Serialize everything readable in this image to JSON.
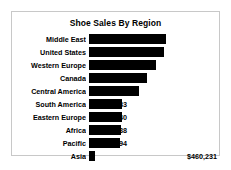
{
  "chart_data": {
    "type": "bar",
    "orientation": "horizontal",
    "title": "Shoe Sales By Region",
    "xlabel": "",
    "ylabel": "",
    "grid": false,
    "legend": false,
    "value_prefix": "$",
    "categories": [
      "Middle East",
      "United States",
      "Western Europe",
      "Canada",
      "Central America",
      "South America",
      "Eastern Europe",
      "Africa",
      "Pacific",
      "Asia"
    ],
    "values": [
      5631779,
      5503986,
      4873000,
      4255712,
      3657753,
      2434783,
      2394940,
      2342588,
      2296794,
      460231
    ],
    "value_labels": [
      "$5,631,779",
      "$5,503,986",
      "$4,873,000",
      "$4,255,712",
      "$3,657,753",
      "$2,434,783",
      "$2,394,940",
      "$2,342,588",
      "$2,296,794",
      "$460,231"
    ],
    "xlim": [
      0,
      5631779
    ],
    "bar_color": "#000000",
    "frame_color": "#c8c8c8",
    "background": "#ffffff"
  }
}
